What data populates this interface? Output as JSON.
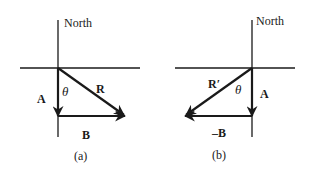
{
  "colors": {
    "ink": "#1a1a1a",
    "background": "#ffffff"
  },
  "panels": [
    {
      "id": "a",
      "caption": "(a)",
      "axis_label": "North",
      "angle_label": "θ",
      "vectors": [
        {
          "name": "A",
          "label": "A",
          "direction": "south"
        },
        {
          "name": "B",
          "label": "B",
          "direction": "east"
        },
        {
          "name": "R",
          "label": "R",
          "direction": "south-east (resultant)"
        }
      ]
    },
    {
      "id": "b",
      "caption": "(b)",
      "axis_label": "North",
      "angle_label": "θ",
      "vectors": [
        {
          "name": "A",
          "label": "A",
          "direction": "south"
        },
        {
          "name": "-B",
          "label": "–B",
          "direction": "west"
        },
        {
          "name": "R'",
          "label": "R′",
          "direction": "south-west (resultant)"
        }
      ]
    }
  ]
}
